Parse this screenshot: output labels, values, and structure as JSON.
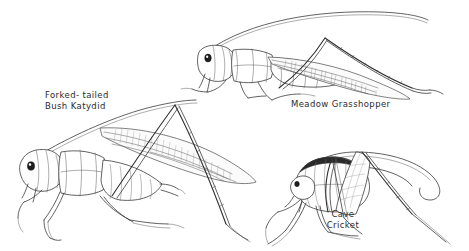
{
  "plate": {
    "background_color": "#ffffff",
    "ink_color": "#3a3a3a",
    "width": 469,
    "height": 251,
    "subject": "pen-and-ink illustration plate of three orthopteran insects"
  },
  "labels": {
    "katydid": "Forked- tailed\nBush Katydid",
    "grasshopper": "Meadow Grasshopper",
    "cricket": "Cave\nCricket"
  },
  "figures": [
    {
      "name": "forked-tailed-bush-katydid",
      "label": "Forked- tailed Bush Katydid",
      "position": "lower-left",
      "facing": "left"
    },
    {
      "name": "meadow-grasshopper",
      "label": "Meadow Grasshopper",
      "position": "upper-right",
      "facing": "left"
    },
    {
      "name": "cave-cricket",
      "label": "Cave Cricket",
      "position": "lower-right",
      "facing": "left"
    }
  ]
}
